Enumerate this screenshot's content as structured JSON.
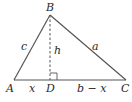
{
  "diagram": {
    "type": "triangle-with-altitude",
    "vertices": {
      "A": {
        "label": "A",
        "x": 14,
        "y": 80
      },
      "B": {
        "label": "B",
        "x": 50,
        "y": 15
      },
      "C": {
        "label": "C",
        "x": 126,
        "y": 80
      },
      "D": {
        "label": "D",
        "x": 50,
        "y": 80
      }
    },
    "sides": {
      "c": "c",
      "a": "a",
      "h": "h",
      "x": "x",
      "b_minus_x": "b − x"
    },
    "colors": {
      "line": "#555555",
      "text": "#2a2a2a"
    }
  }
}
